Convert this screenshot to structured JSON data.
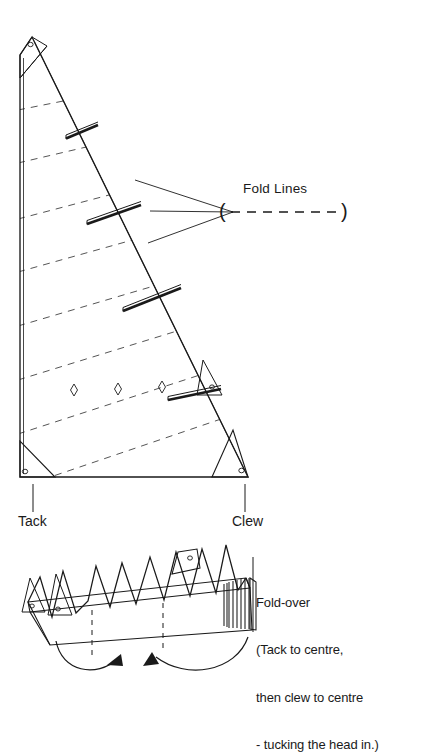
{
  "diagram": {
    "type": "technical-line-drawing",
    "stroke_color": "#1a1a1a",
    "fold_line_color": "#555555",
    "background": "#ffffff"
  },
  "labels": {
    "fold_lines": "Fold Lines",
    "fold_lines_legend": "( –  –  –  –  –  –  –  – )",
    "tack": "Tack",
    "clew": "Clew",
    "foldover_title": "Fold-over",
    "foldover_line2": "(Tack to centre,",
    "foldover_line3": "then clew to centre",
    "foldover_line4": "- tucking the head in.)"
  },
  "sail": {
    "description": "Triangular mainsail shown flat with diagonal dashed fold lines",
    "corners": {
      "head": "top",
      "tack": "bottom-left",
      "clew": "bottom-right"
    },
    "fold_line_count": 8,
    "batten_count": 4,
    "telltale_count": 3,
    "grommet_count": 4,
    "corner_patch_count": 4
  },
  "folded_bundle": {
    "description": "Accordion / concertina folded sail in perspective with head tucked in",
    "peak_count": 7,
    "arrow_count": 2,
    "centre_marker_count": 2
  }
}
